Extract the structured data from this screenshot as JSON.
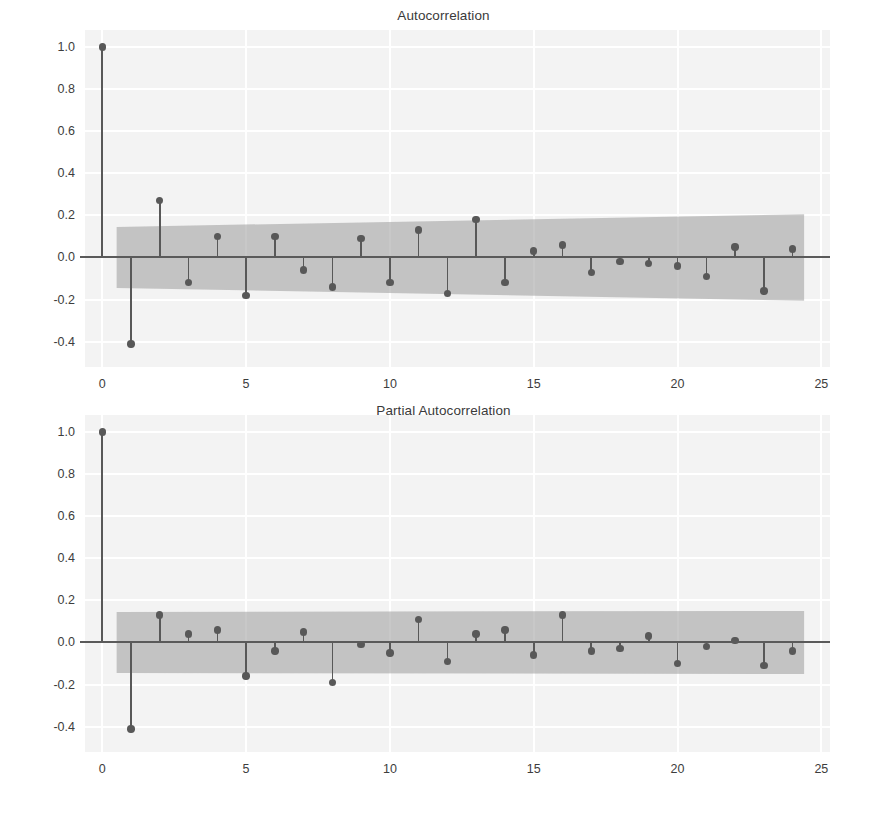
{
  "figure": {
    "width": 887,
    "height": 824,
    "background": "#ffffff",
    "plot_background": "#f3f3f3",
    "grid_color": "#ffffff",
    "stem_color": "#585858",
    "ci_color": "#9a9a9a",
    "axis_color": "#5a5a5a"
  },
  "chart_data": [
    {
      "type": "line",
      "subtype": "stem-acf",
      "title": "Autocorrelation",
      "xlabel": "",
      "ylabel": "",
      "xlim": [
        -0.6,
        25.3
      ],
      "ylim": [
        -0.52,
        1.08
      ],
      "xticks": [
        0,
        5,
        10,
        15,
        20,
        25
      ],
      "yticks": [
        1.0,
        0.8,
        0.6,
        0.4,
        0.2,
        0.0,
        -0.2,
        -0.4
      ],
      "xticklabels": [
        "0",
        "5",
        "10",
        "15",
        "20",
        "25"
      ],
      "yticklabels": [
        "1.0",
        "0.8",
        "0.6",
        "0.4",
        "0.2",
        "0.0",
        "-0.2",
        "-0.4"
      ],
      "grid": true,
      "legend": "none",
      "x": [
        0,
        1,
        2,
        3,
        4,
        5,
        6,
        7,
        8,
        9,
        10,
        11,
        12,
        13,
        14,
        15,
        16,
        17,
        18,
        19,
        20,
        21,
        22,
        23,
        24
      ],
      "values": [
        1.0,
        -0.41,
        0.27,
        -0.12,
        0.1,
        -0.18,
        0.1,
        -0.06,
        -0.14,
        0.09,
        -0.12,
        0.13,
        -0.17,
        0.18,
        -0.12,
        0.03,
        0.06,
        -0.07,
        -0.02,
        -0.03,
        -0.04,
        -0.09,
        0.05,
        -0.16,
        0.04
      ],
      "confidence_band": {
        "label": "95% confidence interval",
        "x_start": 0.5,
        "x_end": 24.4,
        "upper_start": 0.145,
        "upper_end": 0.205,
        "lower_start": -0.145,
        "lower_end": -0.205
      }
    },
    {
      "type": "line",
      "subtype": "stem-pacf",
      "title": "Partial Autocorrelation",
      "xlabel": "",
      "ylabel": "",
      "xlim": [
        -0.6,
        25.3
      ],
      "ylim": [
        -0.52,
        1.08
      ],
      "xticks": [
        0,
        5,
        10,
        15,
        20,
        25
      ],
      "yticks": [
        1.0,
        0.8,
        0.6,
        0.4,
        0.2,
        0.0,
        -0.2,
        -0.4
      ],
      "xticklabels": [
        "0",
        "5",
        "10",
        "15",
        "20",
        "25"
      ],
      "yticklabels": [
        "1.0",
        "0.8",
        "0.6",
        "0.4",
        "0.2",
        "0.0",
        "-0.2",
        "-0.4"
      ],
      "grid": true,
      "legend": "none",
      "x": [
        0,
        1,
        2,
        3,
        4,
        5,
        6,
        7,
        8,
        9,
        10,
        11,
        12,
        13,
        14,
        15,
        16,
        17,
        18,
        19,
        20,
        21,
        22,
        23,
        24
      ],
      "values": [
        1.0,
        -0.41,
        0.13,
        0.04,
        0.06,
        -0.16,
        -0.04,
        0.05,
        -0.19,
        -0.01,
        -0.05,
        0.11,
        -0.09,
        0.04,
        0.06,
        -0.06,
        0.13,
        -0.04,
        -0.03,
        0.03,
        -0.1,
        -0.02,
        0.01,
        -0.11,
        -0.04
      ],
      "confidence_band": {
        "label": "95% confidence interval",
        "x_start": 0.5,
        "x_end": 24.4,
        "upper_start": 0.145,
        "upper_end": 0.15,
        "lower_start": -0.145,
        "lower_end": -0.15
      }
    }
  ]
}
